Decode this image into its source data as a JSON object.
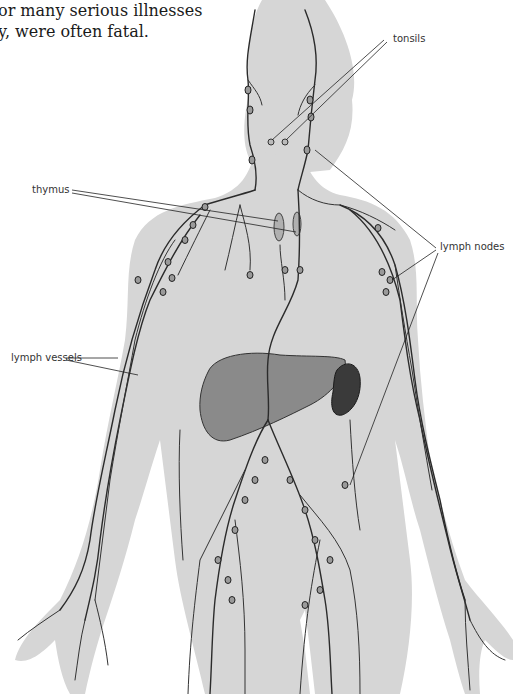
{
  "caption": {
    "line1": "or many serious illnesses",
    "line2": "y, were often fatal."
  },
  "labels": {
    "tonsils": "tonsils",
    "thymus": "thymus",
    "lymph_nodes": "lymph nodes",
    "lymph_vessels": "lymph vessels"
  },
  "colors": {
    "body_fill": "#d6d6d6",
    "vessel_stroke": "#2b2b2b",
    "liver_fill": "#8a8a8a",
    "spleen_fill": "#3a3a3a",
    "thymus_fill": "#b0b0b0",
    "background": "#ffffff"
  },
  "figure": {
    "organs_shown": [
      "tonsils",
      "thymus",
      "liver",
      "spleen",
      "lymph nodes",
      "lymph vessels"
    ]
  }
}
